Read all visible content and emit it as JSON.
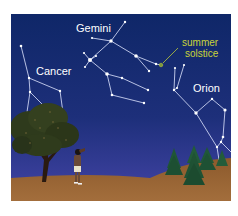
{
  "figure": {
    "labels": {
      "gemini": "Gemini",
      "cancer": "Cancer",
      "orion": "Orion",
      "solstice_line1": "summer",
      "solstice_line2": "solstice"
    },
    "colors": {
      "sky_top": "#10286a",
      "sky_bottom": "#3b3f9e",
      "ground": "#94622f",
      "star": "#ffffff",
      "solstice": "#c9d43a",
      "tree_foliage": "#2f3a1e",
      "pine": "#1f5a3a"
    },
    "constellations": [
      "Cancer",
      "Gemini",
      "Orion"
    ],
    "scene_elements": [
      "tree",
      "person looking up",
      "pine trees",
      "hillside"
    ]
  }
}
